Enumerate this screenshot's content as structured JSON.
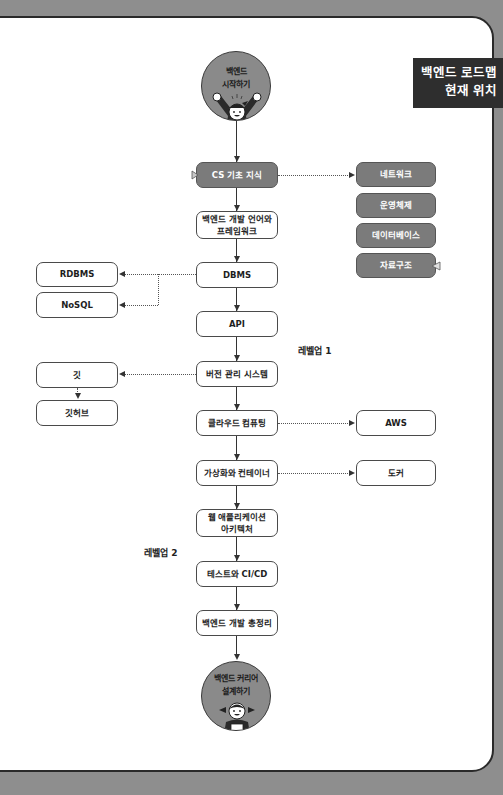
{
  "banner": {
    "line1": "백엔드 로드맵\n현재 위치"
  },
  "start": {
    "label": "백엔드\n시작하기",
    "icon": "cheering-mascot-icon"
  },
  "end": {
    "label": "백엔드 커리어\n설계하기",
    "icon": "mascot-girl-icon"
  },
  "main_nodes": [
    {
      "id": "cs",
      "label": "CS 기초 지식",
      "style": "dark"
    },
    {
      "id": "lang",
      "label": "백엔드 개발 언어와\n프레임워크",
      "style": "light"
    },
    {
      "id": "dbms",
      "label": "DBMS",
      "style": "light"
    },
    {
      "id": "api",
      "label": "API",
      "style": "light"
    },
    {
      "id": "vcs",
      "label": "버전 관리 시스템",
      "style": "light"
    },
    {
      "id": "cloud",
      "label": "클라우드 컴퓨팅",
      "style": "light"
    },
    {
      "id": "virt",
      "label": "가상화와 컨테이너",
      "style": "light"
    },
    {
      "id": "webarch",
      "label": "웹 애플리케이션\n아키텍처",
      "style": "light"
    },
    {
      "id": "cicd",
      "label": "테스트와 CI/CD",
      "style": "light"
    },
    {
      "id": "summary",
      "label": "백엔드 개발 총정리",
      "style": "light"
    }
  ],
  "cs_children": [
    {
      "label": "네트워크"
    },
    {
      "label": "운영체제"
    },
    {
      "label": "데이터베이스"
    },
    {
      "label": "자료구조"
    }
  ],
  "dbms_children": [
    {
      "label": "RDBMS"
    },
    {
      "label": "NoSQL"
    }
  ],
  "vcs_children": [
    {
      "label": "깃"
    },
    {
      "label": "깃허브"
    }
  ],
  "cloud_children": [
    {
      "label": "AWS"
    }
  ],
  "virt_children": [
    {
      "label": "도커"
    }
  ],
  "levels": [
    {
      "label": "레벨업 1"
    },
    {
      "label": "레벨업 2"
    }
  ],
  "colors": {
    "dark_node": "#7b7b7b",
    "light_node": "#ffffff",
    "circle": "#8a8a8a",
    "banner": "#2e2e2e",
    "background": "#8e8e8e"
  }
}
